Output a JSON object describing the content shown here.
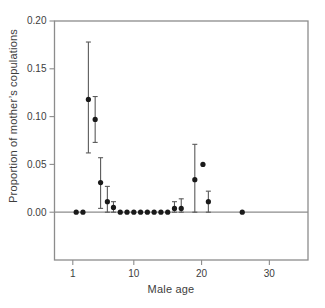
{
  "figure": {
    "background": "#ffffff"
  },
  "chart_data": {
    "type": "scatter",
    "title": "",
    "xlabel": "Male age",
    "ylabel": "Proportion of mother’s copulations",
    "xlim": [
      -1.7,
      35.7
    ],
    "ylim": [
      -0.05,
      0.2
    ],
    "grid": false,
    "legend": null,
    "x_ticks": [
      {
        "v": 1,
        "label": "1"
      },
      {
        "v": 10,
        "label": "10"
      },
      {
        "v": 20,
        "label": "20"
      },
      {
        "v": 30,
        "label": "30"
      }
    ],
    "y_ticks": [
      {
        "v": 0.0,
        "label": "0.00"
      },
      {
        "v": 0.05,
        "label": "0.05"
      },
      {
        "v": 0.1,
        "label": "0.10"
      },
      {
        "v": 0.15,
        "label": "0.15"
      },
      {
        "v": 0.2,
        "label": "0.20"
      }
    ],
    "zero_line_y": 0,
    "colors": {
      "marker": "#1a1a1a",
      "error_bar": "#5a5a5a",
      "axis": "#8c8c8c",
      "text": "#3d3d3d"
    },
    "points": [
      {
        "x": 1.5,
        "y": 0.0,
        "lo": null,
        "hi": null
      },
      {
        "x": 2.5,
        "y": 0.0,
        "lo": null,
        "hi": null
      },
      {
        "x": 3.3,
        "y": 0.118,
        "lo": 0.062,
        "hi": 0.178
      },
      {
        "x": 4.3,
        "y": 0.097,
        "lo": 0.073,
        "hi": 0.121
      },
      {
        "x": 5.1,
        "y": 0.031,
        "lo": 0.004,
        "hi": 0.057
      },
      {
        "x": 6.1,
        "y": 0.011,
        "lo": 0.0,
        "hi": 0.027
      },
      {
        "x": 7.0,
        "y": 0.005,
        "lo": 0.0,
        "hi": 0.011
      },
      {
        "x": 8.0,
        "y": 0.0,
        "lo": null,
        "hi": null
      },
      {
        "x": 9.0,
        "y": 0.0,
        "lo": null,
        "hi": null
      },
      {
        "x": 10.0,
        "y": 0.0,
        "lo": null,
        "hi": null
      },
      {
        "x": 11.0,
        "y": 0.0,
        "lo": null,
        "hi": null
      },
      {
        "x": 12.0,
        "y": 0.0,
        "lo": null,
        "hi": null
      },
      {
        "x": 13.0,
        "y": 0.0,
        "lo": null,
        "hi": null
      },
      {
        "x": 14.0,
        "y": 0.0,
        "lo": null,
        "hi": null
      },
      {
        "x": 15.0,
        "y": 0.0,
        "lo": null,
        "hi": null
      },
      {
        "x": 16.0,
        "y": 0.004,
        "lo": 0.0,
        "hi": 0.011
      },
      {
        "x": 17.0,
        "y": 0.004,
        "lo": 0.0,
        "hi": 0.014
      },
      {
        "x": 19.0,
        "y": 0.034,
        "lo": 0.0,
        "hi": 0.071
      },
      {
        "x": 20.2,
        "y": 0.05,
        "lo": null,
        "hi": null
      },
      {
        "x": 21.0,
        "y": 0.011,
        "lo": 0.0,
        "hi": 0.022
      },
      {
        "x": 26.0,
        "y": 0.0,
        "lo": null,
        "hi": null
      }
    ]
  }
}
